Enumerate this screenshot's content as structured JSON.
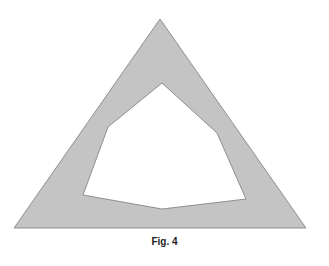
{
  "figure": {
    "caption": "Fig. 4",
    "fill_color": "#c4c4c4",
    "stroke_color": "#7a7a7a",
    "background": "#ffffff",
    "outer_triangle": {
      "points": [
        [
          160,
          19
        ],
        [
          306,
          228
        ],
        [
          14,
          228
        ]
      ]
    },
    "inner_hole": {
      "points": [
        [
          162,
          83
        ],
        [
          217,
          133
        ],
        [
          246,
          199
        ],
        [
          162,
          209
        ],
        [
          83,
          195
        ],
        [
          108,
          127
        ]
      ]
    }
  }
}
